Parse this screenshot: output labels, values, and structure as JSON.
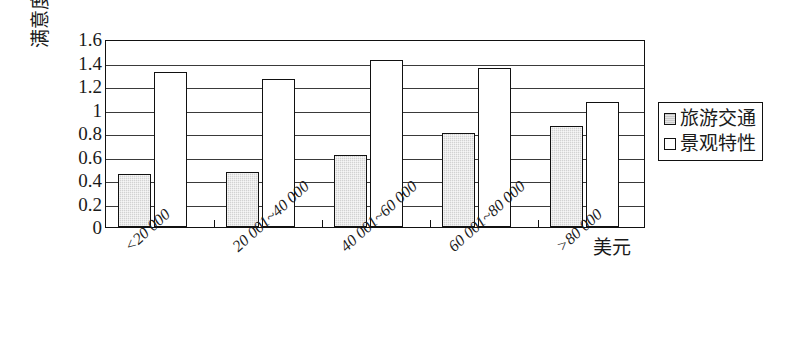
{
  "chart_data": {
    "type": "bar",
    "title": "",
    "xlabel": "美元",
    "ylabel": "满意度均值",
    "ylim": [
      0,
      1.6
    ],
    "ytick_labels": [
      "1.6",
      "1.4",
      "1.2",
      "1",
      "0.8",
      "0.6",
      "0.4",
      "0.2",
      "0"
    ],
    "ytick_values": [
      1.6,
      1.4,
      1.2,
      1.0,
      0.8,
      0.6,
      0.4,
      0.2,
      0
    ],
    "grid": true,
    "legend_position": "right",
    "categories": [
      "<20 000",
      "20 001~40 000",
      "40 001~60 000",
      "60 001~80 000",
      ">80 000"
    ],
    "series": [
      {
        "name": "旅游交通",
        "color": "#d2d2d2",
        "values": [
          0.45,
          0.47,
          0.61,
          0.8,
          0.86
        ]
      },
      {
        "name": "景观特性",
        "color": "#ffffff",
        "values": [
          1.32,
          1.26,
          1.42,
          1.35,
          1.06
        ]
      }
    ]
  },
  "legend": {
    "items": [
      {
        "label": "旅游交通"
      },
      {
        "label": "景观特性"
      }
    ]
  },
  "axis": {
    "y_title": "满意度均值",
    "x_unit": "美元"
  }
}
